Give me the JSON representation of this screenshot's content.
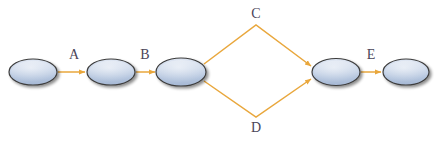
{
  "diagram": {
    "type": "directed-graph",
    "canvas": {
      "width": 438,
      "height": 143,
      "background": "#ffffff"
    },
    "style": {
      "node_fill_top": "#d7e0ef",
      "node_fill_bottom": "#aebfd8",
      "node_stroke": "#3d3d3d",
      "edge_color": "#e9a73c",
      "label_color": "#4a4458",
      "shadow_color": "#b9b9b9"
    },
    "nodes": [
      {
        "id": "n1",
        "label": "",
        "cx": 33,
        "cy": 72,
        "rx": 24,
        "ry": 13
      },
      {
        "id": "n2",
        "label": "",
        "cx": 111,
        "cy": 72,
        "rx": 24,
        "ry": 13
      },
      {
        "id": "n3",
        "label": "",
        "cx": 182,
        "cy": 72,
        "rx": 25,
        "ry": 14
      },
      {
        "id": "n4",
        "label": "",
        "cx": 336,
        "cy": 72,
        "rx": 24,
        "ry": 13
      },
      {
        "id": "n5",
        "label": "",
        "cx": 406,
        "cy": 72,
        "rx": 23,
        "ry": 13
      }
    ],
    "edges": [
      {
        "id": "e-a",
        "label": "A",
        "from": "n1",
        "to": "n2",
        "shape": "straight",
        "x1": 58,
        "y1": 72,
        "x2": 86,
        "y2": 72,
        "label_x": 74,
        "label_y": 55
      },
      {
        "id": "e-b",
        "label": "B",
        "from": "n2",
        "to": "n3",
        "shape": "straight",
        "x1": 136,
        "y1": 72,
        "x2": 156,
        "y2": 72,
        "label_x": 145,
        "label_y": 55
      },
      {
        "id": "e-c",
        "label": "C",
        "from": "n3",
        "to": "n4",
        "shape": "elbow-up",
        "x1": 205,
        "y1": 63,
        "mx": 256,
        "my": 24,
        "x2": 312,
        "y2": 66,
        "label_x": 256,
        "label_y": 14
      },
      {
        "id": "e-d",
        "label": "D",
        "from": "n3",
        "to": "n4",
        "shape": "elbow-down",
        "x1": 205,
        "y1": 82,
        "mx": 256,
        "my": 118,
        "x2": 312,
        "y2": 78,
        "label_x": 256,
        "label_y": 128
      },
      {
        "id": "e-e",
        "label": "E",
        "from": "n4",
        "to": "n5",
        "shape": "straight",
        "x1": 361,
        "y1": 72,
        "x2": 382,
        "y2": 72,
        "label_x": 371,
        "label_y": 55
      }
    ],
    "labels": {
      "a": "A",
      "b": "B",
      "c": "C",
      "d": "D",
      "e": "E"
    }
  }
}
